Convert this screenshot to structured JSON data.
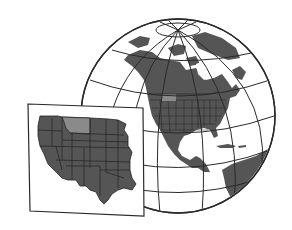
{
  "illustration": {
    "title": "North America globe with western US inset map",
    "colors": {
      "background": "#ffffff",
      "land": "#555555",
      "highlight_state": "#8a8a8a",
      "outline": "#2a2a2a",
      "state_borders": "#222222",
      "ocean": "#ffffff",
      "panel_fill": "#ffffff"
    },
    "globe": {
      "center": [
        178,
        116
      ],
      "radius": 97,
      "continents": [
        "North America",
        "Greenland",
        "Central America",
        "South America",
        "Caribbean islands"
      ]
    },
    "inset": {
      "region": "Western United States",
      "highlighted_state": "Montana"
    }
  }
}
